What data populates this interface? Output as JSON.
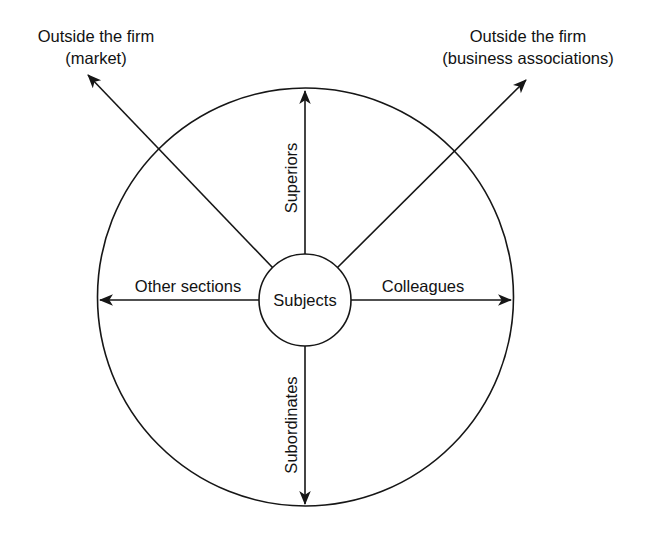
{
  "figure": {
    "kind": "radial-relationship-diagram",
    "center_node": "Subjects",
    "background_color": "#ffffff",
    "stroke_color": "#161616"
  },
  "center": {
    "label": "Subjects"
  },
  "spokes": [
    {
      "id": "superiors",
      "label": "Superiors",
      "direction": "up",
      "orientation": "vertical-rotated",
      "arrow": "outward",
      "terminates_at": "boundary"
    },
    {
      "id": "subordinates",
      "label": "Subordinates",
      "direction": "down",
      "orientation": "vertical-rotated",
      "arrow": "outward",
      "terminates_at": "boundary"
    },
    {
      "id": "other-sections",
      "label": "Other sections",
      "direction": "left",
      "orientation": "horizontal",
      "arrow": "outward",
      "terminates_at": "boundary"
    },
    {
      "id": "colleagues",
      "label": "Colleagues",
      "direction": "right",
      "orientation": "horizontal",
      "arrow": "outward",
      "terminates_at": "boundary"
    }
  ],
  "external_arrows": [
    {
      "id": "market",
      "direction": "up-left",
      "arrow": "outward",
      "terminates_at": "outside-boundary",
      "label_line1": "Outside the firm",
      "label_line2": "(market)"
    },
    {
      "id": "business-associations",
      "direction": "up-right",
      "arrow": "outward",
      "terminates_at": "outside-boundary",
      "label_line1": "Outside the firm",
      "label_line2": "(business associations)"
    }
  ],
  "boundary": {
    "name": "firm-boundary-circle"
  },
  "caption": {
    "text": ""
  }
}
